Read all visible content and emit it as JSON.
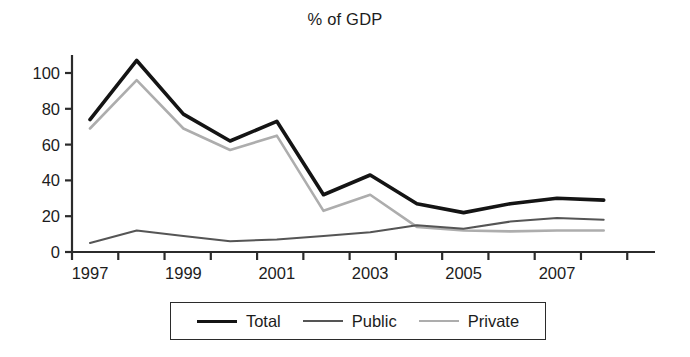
{
  "chart_data": {
    "type": "line",
    "title": "% of GDP",
    "xlabel": "",
    "ylabel": "",
    "x": [
      1997,
      1998,
      1999,
      2000,
      2001,
      2002,
      2003,
      2004,
      2005,
      2006,
      2007,
      2008
    ],
    "xtick_labels": [
      "1997",
      "",
      "1999",
      "",
      "2001",
      "",
      "2003",
      "",
      "2005",
      "",
      "2007",
      ""
    ],
    "xtick_labels_visible": [
      "1997",
      "1999",
      "2001",
      "2003",
      "2005",
      "2007"
    ],
    "ytick_labels": [
      "0",
      "20",
      "40",
      "60",
      "80",
      "100"
    ],
    "yticks": [
      0,
      20,
      40,
      60,
      80,
      100
    ],
    "ylim": [
      0,
      112
    ],
    "xlim": [
      1996.8,
      2008.6
    ],
    "grid": false,
    "legend_position": "below-center",
    "series": [
      {
        "name": "Total",
        "color": "#141414",
        "width": 3.6,
        "values": [
          74,
          107,
          77,
          62,
          73,
          32,
          43,
          27,
          22,
          27,
          30,
          29
        ]
      },
      {
        "name": "Public",
        "color": "#555555",
        "width": 2.0,
        "values": [
          5,
          12,
          9,
          6,
          7,
          9,
          11,
          15,
          13,
          17,
          19,
          18
        ]
      },
      {
        "name": "Private",
        "color": "#adadad",
        "width": 2.6,
        "values": [
          69,
          96,
          69,
          57,
          65,
          23,
          32,
          14,
          12,
          11.5,
          12,
          12
        ]
      }
    ]
  },
  "legend": {
    "items": [
      {
        "label": "Total"
      },
      {
        "label": "Public"
      },
      {
        "label": "Private"
      }
    ]
  },
  "axis": {
    "line_color": "#2b2b2b"
  }
}
